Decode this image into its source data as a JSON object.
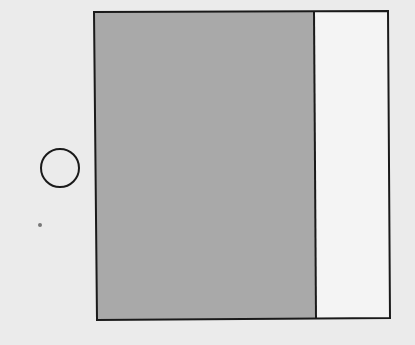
{
  "diagram": {
    "background_color": "#ebebeb",
    "stroke_color": "#1a1a1a",
    "shapes": {
      "outer_rectangle": {
        "x1": 95,
        "y1": 12,
        "x2": 389,
        "y2": 319
      },
      "shaded_region": {
        "fill": "#a9a9a9",
        "x_left": 95,
        "x_right": 314
      },
      "unshaded_region": {
        "fill": "#f2f2f2",
        "x_left": 314,
        "x_right": 389
      },
      "divider_line": {
        "x": 314
      },
      "circle": {
        "cx": 60,
        "cy": 168,
        "r": 19
      },
      "dot": {
        "cx": 40,
        "cy": 225,
        "r": 2
      }
    }
  }
}
